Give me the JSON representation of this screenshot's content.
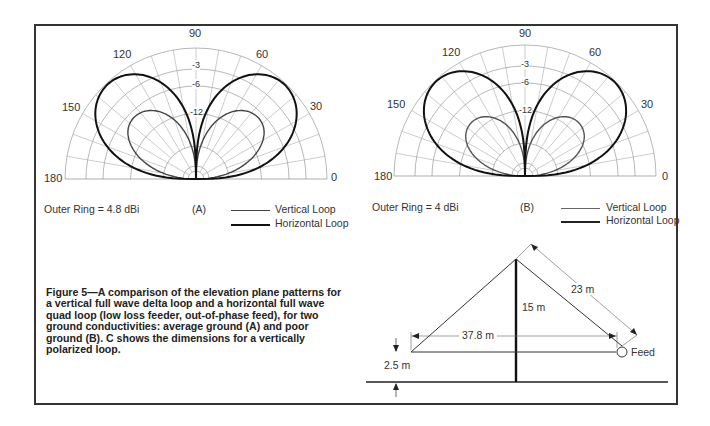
{
  "figure": {
    "caption": "Figure 5—A comparison of the elevation plane patterns for a vertical full wave delta loop and a horizontal full wave quad loop (low loss feeder, out-of-phase feed), for two ground conductivities: average ground (A) and poor ground (B). C shows the dimensions for a vertically polarized loop."
  },
  "chart_data": [
    {
      "type": "polar",
      "panel": "(A)",
      "title": "Elevation plane patterns — average ground",
      "outer_ring": "Outer Ring = 4.8 dBi",
      "angle_labels": [
        "0",
        "30",
        "60",
        "90",
        "120",
        "150",
        "180"
      ],
      "ring_labels": [
        "-3",
        "-6",
        "-12",
        "-24"
      ],
      "legend": [
        {
          "name": "Vertical Loop",
          "color": "#444444",
          "width": 1.4
        },
        {
          "name": "Horizontal Loop",
          "color": "#111111",
          "width": 2.0
        }
      ],
      "series": [
        {
          "name": "Vertical Loop",
          "peak_elevation_deg": 25,
          "peak_db": -6.5,
          "lobe": "low-angle"
        },
        {
          "name": "Horizontal Loop",
          "peak_elevation_deg": 40,
          "peak_db": 0,
          "lobe": "high-angle"
        }
      ]
    },
    {
      "type": "polar",
      "panel": "(B)",
      "title": "Elevation plane patterns — poor ground",
      "outer_ring": "Outer Ring = 4 dBi",
      "angle_labels": [
        "0",
        "30",
        "60",
        "90",
        "120",
        "150",
        "180"
      ],
      "ring_labels": [
        "-3",
        "-6",
        "-12",
        "-24"
      ],
      "legend": [
        {
          "name": "Vertical Loop",
          "color": "#555555",
          "width": 1.4
        },
        {
          "name": "Horizontal Loop",
          "color": "#111111",
          "width": 2.0
        }
      ],
      "series": [
        {
          "name": "Vertical Loop",
          "peak_elevation_deg": 22,
          "peak_db": -9,
          "lobe": "low-angle"
        },
        {
          "name": "Horizontal Loop",
          "peak_elevation_deg": 38,
          "peak_db": 0,
          "lobe": "high-angle"
        }
      ]
    }
  ],
  "diagram_c": {
    "dimensions": {
      "side": "23 m",
      "height": "15 m",
      "base": "37.8 m",
      "ground_clearance": "2.5 m"
    },
    "feed_label": "Feed"
  }
}
